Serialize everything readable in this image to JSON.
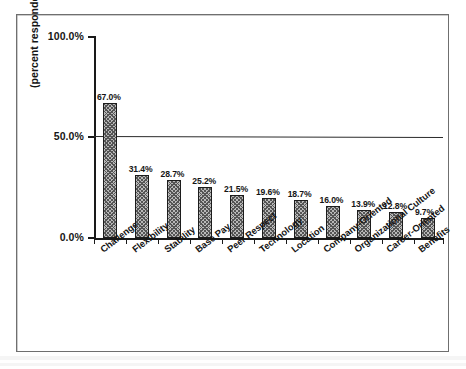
{
  "chart_data": {
    "type": "bar",
    "title": "",
    "xlabel": "",
    "ylabel": "(percent responded)",
    "ylim": [
      0,
      100
    ],
    "ytick_labels": [
      "0.0%",
      "50.0%",
      "100.0%"
    ],
    "ytick_values": [
      0,
      50,
      100
    ],
    "grid": false,
    "legend": "none",
    "annotations": [
      {
        "name": "reference-line",
        "kind": "horizontal-line",
        "value": 50,
        "label": ""
      }
    ],
    "categories": [
      "Challenge",
      "Flexibility",
      "Stability",
      "Base Pay",
      "Peer Respect",
      "Technology",
      "Location",
      "Company-Oriented",
      "Organizational Culture",
      "Career-Oriented",
      "Benefits"
    ],
    "values": [
      67.0,
      31.4,
      28.7,
      25.2,
      21.5,
      19.6,
      18.7,
      16.0,
      13.9,
      12.8,
      9.7
    ],
    "data_labels": [
      "67.0%",
      "31.4%",
      "28.7%",
      "25.2%",
      "21.5%",
      "19.6%",
      "18.7%",
      "16.0%",
      "13.9%",
      "12.8%",
      "9.7%"
    ],
    "colors": {
      "bar_fill": "#b9b9b9",
      "bar_hatch": "#555555",
      "bar_edge": "#1c1c1c",
      "axis": "#1a1a1a",
      "reference_line": "#2b2b2b",
      "text": "#141414",
      "frame": "#6f6f6f",
      "background": "#ffffff"
    }
  }
}
